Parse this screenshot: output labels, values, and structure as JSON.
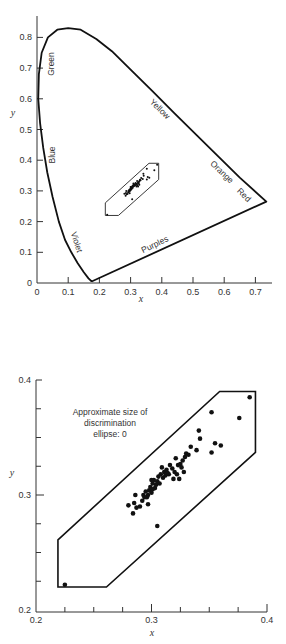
{
  "chart_data": [
    {
      "type": "scatter",
      "title": "",
      "xlabel": "x",
      "ylabel": "y",
      "xlim": [
        0,
        0.76
      ],
      "ylim": [
        0,
        0.86
      ],
      "grid": false,
      "x_ticks": [
        "0",
        "0.1",
        "0.2",
        "0.3",
        "0.4",
        "0.5",
        "0.6",
        "0.7"
      ],
      "y_ticks": [
        "0",
        "0.1",
        "0.2",
        "0.3",
        "0.4",
        "0.5",
        "0.6",
        "0.7",
        "0.8"
      ],
      "spectral_locus": [
        [
          0.175,
          0.005
        ],
        [
          0.165,
          0.015
        ],
        [
          0.15,
          0.035
        ],
        [
          0.13,
          0.065
        ],
        [
          0.11,
          0.1
        ],
        [
          0.09,
          0.14
        ],
        [
          0.07,
          0.2
        ],
        [
          0.05,
          0.28
        ],
        [
          0.033,
          0.36
        ],
        [
          0.02,
          0.44
        ],
        [
          0.01,
          0.52
        ],
        [
          0.004,
          0.6
        ],
        [
          0.006,
          0.68
        ],
        [
          0.015,
          0.75
        ],
        [
          0.035,
          0.8
        ],
        [
          0.065,
          0.825
        ],
        [
          0.1,
          0.83
        ],
        [
          0.14,
          0.825
        ],
        [
          0.19,
          0.795
        ],
        [
          0.24,
          0.755
        ],
        [
          0.3,
          0.695
        ],
        [
          0.37,
          0.625
        ],
        [
          0.44,
          0.553
        ],
        [
          0.51,
          0.483
        ],
        [
          0.58,
          0.413
        ],
        [
          0.65,
          0.343
        ],
        [
          0.735,
          0.265
        ]
      ],
      "purple_line": [
        [
          0.735,
          0.265
        ],
        [
          0.175,
          0.005
        ]
      ],
      "region_labels": [
        {
          "text": "Green",
          "x": 0.05,
          "y": 0.7,
          "angle": -90
        },
        {
          "text": "Blue",
          "x": 0.055,
          "y": 0.41,
          "angle": -90
        },
        {
          "text": "Violet",
          "x": 0.115,
          "y": 0.1,
          "angle": 70
        },
        {
          "text": "Yellow",
          "x": 0.4,
          "y": 0.54,
          "angle": 45
        },
        {
          "text": "Orange",
          "x": 0.6,
          "y": 0.35,
          "angle": 45
        },
        {
          "text": "Red",
          "x": 0.68,
          "y": 0.28,
          "angle": 45
        },
        {
          "text": "Purples",
          "x": 0.36,
          "y": 0.1,
          "angle": -25
        }
      ],
      "enclosure_polygon": [
        [
          0.359,
          0.39
        ],
        [
          0.39,
          0.39
        ],
        [
          0.39,
          0.337
        ],
        [
          0.261,
          0.22
        ],
        [
          0.219,
          0.22
        ],
        [
          0.219,
          0.261
        ]
      ],
      "points_summary": "Cluster of ~60 points along diagonal from (0.22,0.22) to (0.385,0.385)"
    },
    {
      "type": "scatter",
      "title": "",
      "xlabel": "x",
      "ylabel": "y",
      "xlim": [
        0.2,
        0.4
      ],
      "ylim": [
        0.2,
        0.4
      ],
      "grid": false,
      "x_ticks": [
        "0.2",
        "0.3",
        "0.4"
      ],
      "x_minor_step": 0.025,
      "y_ticks": [
        "0.2",
        "0.3",
        "0.4"
      ],
      "y_minor_step": 0.025,
      "annotation": [
        "Approximate size of",
        "discrimination",
        "ellipse: 0"
      ],
      "enclosure_polygon": [
        [
          0.359,
          0.39
        ],
        [
          0.39,
          0.39
        ],
        [
          0.39,
          0.337
        ],
        [
          0.261,
          0.22
        ],
        [
          0.219,
          0.22
        ],
        [
          0.219,
          0.261
        ]
      ],
      "points": [
        [
          0.225,
          0.222
        ],
        [
          0.385,
          0.385
        ],
        [
          0.376,
          0.367
        ],
        [
          0.352,
          0.372
        ],
        [
          0.352,
          0.337
        ],
        [
          0.341,
          0.356
        ],
        [
          0.342,
          0.349
        ],
        [
          0.339,
          0.339
        ],
        [
          0.355,
          0.345
        ],
        [
          0.36,
          0.343
        ],
        [
          0.305,
          0.273
        ],
        [
          0.28,
          0.291
        ],
        [
          0.284,
          0.284
        ],
        [
          0.285,
          0.293
        ],
        [
          0.286,
          0.3
        ],
        [
          0.287,
          0.289
        ],
        [
          0.29,
          0.29
        ],
        [
          0.292,
          0.295
        ],
        [
          0.293,
          0.3
        ],
        [
          0.295,
          0.303
        ],
        [
          0.296,
          0.298
        ],
        [
          0.297,
          0.292
        ],
        [
          0.298,
          0.304
        ],
        [
          0.299,
          0.307
        ],
        [
          0.3,
          0.302
        ],
        [
          0.301,
          0.31
        ],
        [
          0.302,
          0.313
        ],
        [
          0.303,
          0.306
        ],
        [
          0.304,
          0.309
        ],
        [
          0.305,
          0.312
        ],
        [
          0.306,
          0.316
        ],
        [
          0.307,
          0.31
        ],
        [
          0.308,
          0.318
        ],
        [
          0.309,
          0.324
        ],
        [
          0.31,
          0.315
        ],
        [
          0.311,
          0.32
        ],
        [
          0.312,
          0.317
        ],
        [
          0.313,
          0.322
        ],
        [
          0.315,
          0.318
        ],
        [
          0.316,
          0.326
        ],
        [
          0.318,
          0.323
        ],
        [
          0.319,
          0.314
        ],
        [
          0.32,
          0.32
        ],
        [
          0.321,
          0.332
        ],
        [
          0.322,
          0.318
        ],
        [
          0.324,
          0.314
        ],
        [
          0.325,
          0.327
        ],
        [
          0.326,
          0.324
        ],
        [
          0.327,
          0.33
        ],
        [
          0.328,
          0.32
        ],
        [
          0.329,
          0.333
        ],
        [
          0.33,
          0.336
        ],
        [
          0.332,
          0.335
        ],
        [
          0.334,
          0.342
        ],
        [
          0.297,
          0.3
        ],
        [
          0.294,
          0.298
        ],
        [
          0.301,
          0.305
        ],
        [
          0.314,
          0.319
        ],
        [
          0.323,
          0.326
        ],
        [
          0.3,
          0.313
        ]
      ]
    }
  ],
  "labels": {
    "top_x_axis": "x",
    "top_y_axis": "y",
    "bottom_x_axis": "x",
    "bottom_y_axis": "y",
    "region_green": "Green",
    "region_blue": "Blue",
    "region_violet": "Violet",
    "region_yellow": "Yellow",
    "region_orange": "Orange",
    "region_red": "Red",
    "region_purples": "Purples",
    "annot_line1": "Approximate size of",
    "annot_line2": "discrimination",
    "annot_line3": "ellipse: 0"
  },
  "ticks": {
    "top_x": [
      "0",
      "0.1",
      "0.2",
      "0.3",
      "0.4",
      "0.5",
      "0.6",
      "0.7"
    ],
    "top_y": [
      "0",
      "0.1",
      "0.2",
      "0.3",
      "0.4",
      "0.5",
      "0.6",
      "0.7",
      "0.8"
    ],
    "bottom_x": [
      "0.2",
      "0.3",
      "0.4"
    ],
    "bottom_y": [
      "0.2",
      "0.3",
      "0.4"
    ]
  }
}
